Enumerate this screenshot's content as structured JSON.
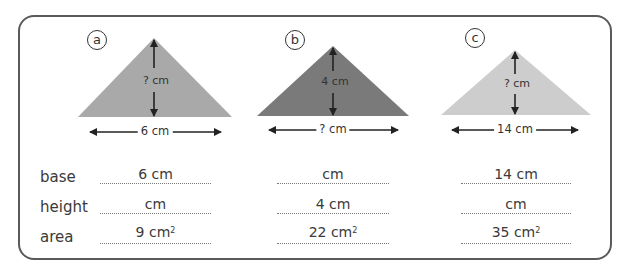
{
  "worksheet": {
    "figures": [
      {
        "id": "a",
        "color": "#a9a9a9",
        "height_label": "? cm",
        "base_label": "6 cm"
      },
      {
        "id": "b",
        "color": "#7a7a7a",
        "height_label": "4 cm",
        "base_label": "? cm"
      },
      {
        "id": "c",
        "color": "#cdcdcd",
        "height_label": "? cm",
        "base_label": "14 cm"
      }
    ],
    "row_labels": {
      "base": "base",
      "height": "height",
      "area": "area"
    },
    "answers": {
      "a": {
        "base": "6 cm",
        "height": "cm",
        "area": "9 cm",
        "area_unit_sup": "2"
      },
      "b": {
        "base": "cm",
        "height": "4 cm",
        "area": "22 cm",
        "area_unit_sup": "2"
      },
      "c": {
        "base": "14 cm",
        "height": "cm",
        "area": "35 cm",
        "area_unit_sup": "2"
      }
    }
  }
}
